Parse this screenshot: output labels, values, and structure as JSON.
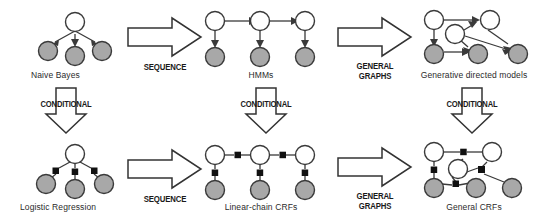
{
  "figure": {
    "width": 547,
    "height": 220,
    "background": "#ffffff",
    "node_open_fill": "#ffffff",
    "node_shaded_fill": "#a8a8a8",
    "node_stroke": "#3a3a3a",
    "factor_fill": "#111111",
    "edge_color": "#3a3a3a",
    "arrow_outline": "#333333",
    "caption_color": "#2b2b2b"
  },
  "models": {
    "naive_bayes": {
      "caption": "Naive Bayes",
      "kind": "directed",
      "open_nodes": 1,
      "shaded_nodes": 3
    },
    "hmms": {
      "caption": "HMMs",
      "kind": "directed",
      "open_nodes": 3,
      "shaded_nodes": 3
    },
    "generative_directed": {
      "caption": "Generative directed models",
      "kind": "directed",
      "open_nodes": 3,
      "shaded_nodes": 3
    },
    "logistic_regression": {
      "caption": "Logistic Regression",
      "kind": "undirected-factor",
      "open_nodes": 1,
      "shaded_nodes": 3,
      "factors": 3
    },
    "linear_chain_crfs": {
      "caption": "Linear-chain CRFs",
      "kind": "undirected-factor",
      "open_nodes": 3,
      "shaded_nodes": 3,
      "factors": 5
    },
    "general_crfs": {
      "caption": "General CRFs",
      "kind": "undirected-factor",
      "open_nodes": 3,
      "shaded_nodes": 3,
      "factors": 4
    }
  },
  "transitions": {
    "sequence_top": {
      "label": "SEQUENCE",
      "direction": "right"
    },
    "general_graphs_top": {
      "label_line1": "GENERAL",
      "label_line2": "GRAPHS",
      "direction": "right"
    },
    "sequence_bottom": {
      "label": "SEQUENCE",
      "direction": "right"
    },
    "general_graphs_bottom": {
      "label_line1": "GENERAL",
      "label_line2": "GRAPHS",
      "direction": "right"
    },
    "conditional_left": {
      "label": "CONDITIONAL",
      "direction": "down"
    },
    "conditional_middle": {
      "label": "CONDITIONAL",
      "direction": "down"
    },
    "conditional_right": {
      "label": "CONDITIONAL",
      "direction": "down"
    }
  }
}
